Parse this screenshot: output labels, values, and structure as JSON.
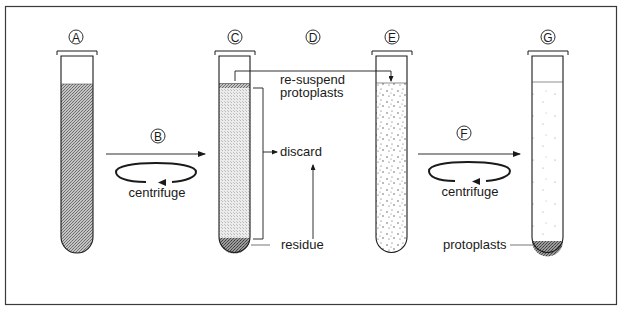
{
  "diagram": {
    "type": "process",
    "description_steps": [
      "A",
      "B",
      "C",
      "D",
      "E",
      "F",
      "G"
    ],
    "colors": {
      "ink": "#1a1a1a",
      "frame": "#3a3a3a",
      "dense_fill": "#a8a8a8",
      "light_fill": "#dadada",
      "pellet": "#6e6e6e"
    }
  },
  "steps": {
    "A": {
      "letter": "A"
    },
    "B": {
      "letter": "B",
      "action": "centrifuge"
    },
    "C": {
      "letter": "C"
    },
    "D": {
      "letter": "D"
    },
    "E": {
      "letter": "E"
    },
    "F": {
      "letter": "F",
      "action": "centrifuge"
    },
    "G": {
      "letter": "G"
    }
  },
  "labels": {
    "resuspend_line1": "re-suspend",
    "resuspend_line2": "protoplasts",
    "discard": "discard",
    "residue": "residue",
    "centrifuge_1": "centrifuge",
    "centrifuge_2": "centrifuge",
    "protoplasts": "protoplasts"
  }
}
